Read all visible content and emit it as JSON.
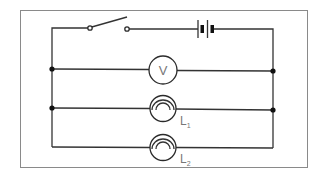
{
  "diagram": {
    "type": "electrical-circuit",
    "colors": {
      "wire": "#333333",
      "frame": "#8a8a8a",
      "label": "#777777",
      "background": "#ffffff"
    },
    "components": {
      "switch": {
        "name": "switch",
        "state": "open"
      },
      "battery": {
        "name": "battery",
        "cells": 2
      },
      "voltmeter": {
        "name": "voltmeter",
        "symbol_text": "V"
      },
      "lamp1": {
        "name": "lamp",
        "label_main": "L",
        "label_sub": "1"
      },
      "lamp2": {
        "name": "lamp",
        "label_main": "L",
        "label_sub": "2"
      }
    },
    "junctions": 4,
    "branches": [
      "voltmeter",
      "lamp L1",
      "lamp L2"
    ]
  }
}
